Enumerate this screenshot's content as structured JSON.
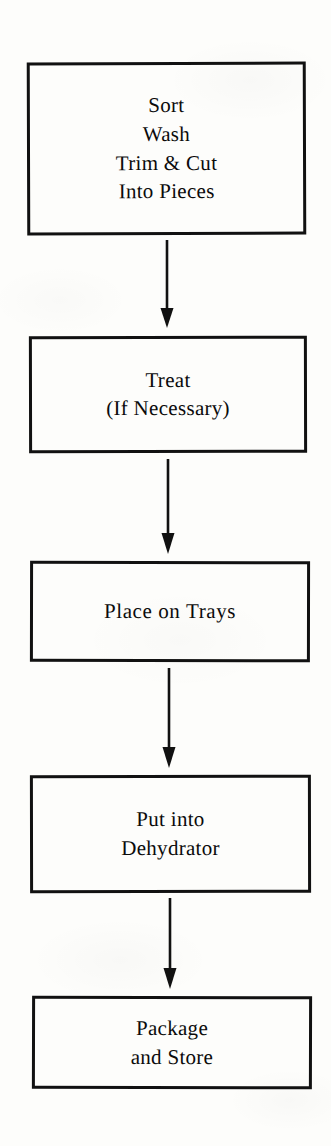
{
  "figure": {
    "type": "flowchart",
    "orientation": "vertical",
    "title": "",
    "background_color": "#fdfdfb",
    "line_color": "#111111",
    "text_color": "#0b0b0b"
  },
  "nodes": [
    {
      "id": "sort-wash-trim",
      "shape": "rectangle",
      "lines": [
        "Sort",
        "Wash",
        "Trim & Cut",
        "Into Pieces"
      ],
      "text": "Sort\nWash\nTrim & Cut\nInto Pieces"
    },
    {
      "id": "treat",
      "shape": "rectangle",
      "lines": [
        "Treat",
        "(If Necessary)"
      ],
      "text": "Treat\n(If Necessary)"
    },
    {
      "id": "place-on-trays",
      "shape": "rectangle",
      "lines": [
        "Place on Trays"
      ],
      "text": "Place on Trays"
    },
    {
      "id": "put-into-dehydrator",
      "shape": "rectangle",
      "lines": [
        "Put into",
        "Dehydrator"
      ],
      "text": "Put into\nDehydrator"
    },
    {
      "id": "package-and-store",
      "shape": "rectangle",
      "lines": [
        "Package",
        "and Store"
      ],
      "text": "Package\nand Store"
    }
  ],
  "connectors": [
    {
      "id": "arrow-1",
      "from": "sort-wash-trim",
      "to": "treat",
      "style": "straight-down-arrow"
    },
    {
      "id": "arrow-2",
      "from": "treat",
      "to": "place-on-trays",
      "style": "straight-down-arrow"
    },
    {
      "id": "arrow-3",
      "from": "place-on-trays",
      "to": "put-into-dehydrator",
      "style": "straight-down-arrow"
    },
    {
      "id": "arrow-4",
      "from": "put-into-dehydrator",
      "to": "package-and-store",
      "style": "straight-down-arrow"
    }
  ]
}
